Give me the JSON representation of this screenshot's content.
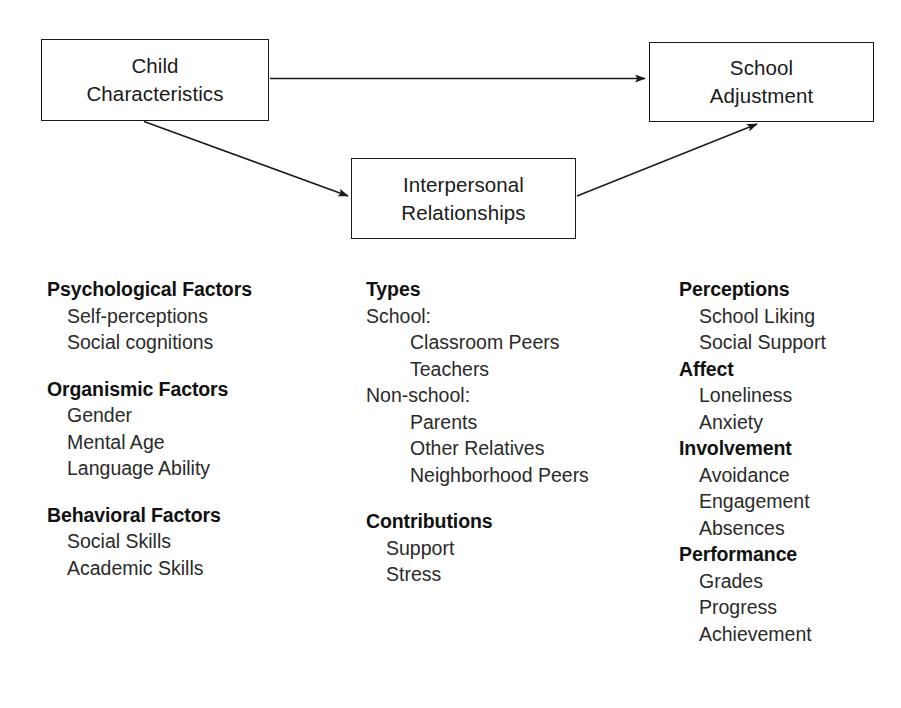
{
  "diagram": {
    "nodes": [
      {
        "id": "child",
        "lines": [
          "Child",
          "Characteristics"
        ]
      },
      {
        "id": "school",
        "lines": [
          "School",
          "Adjustment"
        ]
      },
      {
        "id": "interpersonal",
        "lines": [
          "Interpersonal",
          "Relationships"
        ]
      }
    ],
    "edges": [
      {
        "from": "child",
        "to": "school",
        "style": "straight-horizontal"
      },
      {
        "from": "child",
        "to": "interpersonal",
        "style": "diagonal-down-right"
      },
      {
        "from": "interpersonal",
        "to": "school",
        "style": "diagonal-up-right"
      }
    ],
    "line_color": "#1a1a1a"
  },
  "columns": {
    "child": {
      "groups": [
        {
          "heading": "Psychological Factors",
          "items": [
            {
              "text": "Self-perceptions",
              "level": 1
            },
            {
              "text": "Social cognitions",
              "level": 1
            }
          ]
        },
        {
          "heading": "Organismic Factors",
          "items": [
            {
              "text": "Gender",
              "level": 1
            },
            {
              "text": "Mental Age",
              "level": 1
            },
            {
              "text": "Language Ability",
              "level": 1
            }
          ]
        },
        {
          "heading": "Behavioral Factors",
          "items": [
            {
              "text": "Social Skills",
              "level": 1
            },
            {
              "text": "Academic Skills",
              "level": 1
            }
          ]
        }
      ]
    },
    "interpersonal": {
      "groups": [
        {
          "heading": "Types",
          "items": [
            {
              "text": "School:",
              "level": 0
            },
            {
              "text": "Classroom Peers",
              "level": 2
            },
            {
              "text": "Teachers",
              "level": 2
            },
            {
              "text": "Non-school:",
              "level": 0
            },
            {
              "text": "Parents",
              "level": 2
            },
            {
              "text": "Other Relatives",
              "level": 2
            },
            {
              "text": "Neighborhood Peers",
              "level": 2
            }
          ]
        },
        {
          "heading": "Contributions",
          "items": [
            {
              "text": "Support",
              "level": 1
            },
            {
              "text": "Stress",
              "level": 1
            }
          ]
        }
      ]
    },
    "adjustment": {
      "groups": [
        {
          "heading": "Perceptions",
          "items": [
            {
              "text": "School Liking",
              "level": 1
            },
            {
              "text": "Social Support",
              "level": 1
            }
          ]
        },
        {
          "heading": "Affect",
          "items": [
            {
              "text": "Loneliness",
              "level": 1
            },
            {
              "text": "Anxiety",
              "level": 1
            }
          ]
        },
        {
          "heading": "Involvement",
          "items": [
            {
              "text": "Avoidance",
              "level": 1
            },
            {
              "text": "Engagement",
              "level": 1
            },
            {
              "text": "Absences",
              "level": 1
            }
          ]
        },
        {
          "heading": "Performance",
          "items": [
            {
              "text": "Grades",
              "level": 1
            },
            {
              "text": "Progress",
              "level": 1
            },
            {
              "text": "Achievement",
              "level": 1
            }
          ]
        }
      ]
    }
  }
}
